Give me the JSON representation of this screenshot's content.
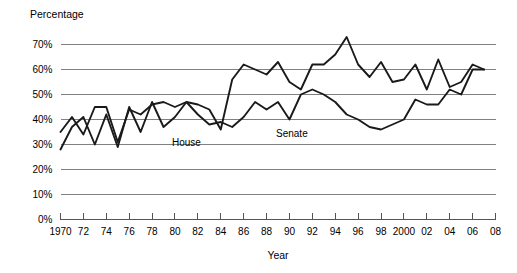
{
  "chart_data": {
    "type": "line",
    "title": "",
    "ylabel": "Percentage",
    "xlabel": "Year",
    "ylim": [
      0,
      70
    ],
    "xlim": [
      1970,
      2008
    ],
    "grid": true,
    "legend_position": "inline-annotation",
    "ytick_labels": [
      "70%",
      "60%",
      "50%",
      "40%",
      "30%",
      "20%",
      "10%",
      "0%"
    ],
    "ytick_values": [
      70,
      60,
      50,
      40,
      30,
      20,
      10,
      0
    ],
    "xtick_labels": [
      "1970",
      "72",
      "74",
      "76",
      "78",
      "80",
      "82",
      "84",
      "86",
      "88",
      "90",
      "92",
      "94",
      "96",
      "98",
      "2000",
      "02",
      "04",
      "06",
      "08"
    ],
    "xtick_values": [
      1970,
      1972,
      1974,
      1976,
      1978,
      1980,
      1982,
      1984,
      1986,
      1988,
      1990,
      1992,
      1994,
      1996,
      1998,
      2000,
      2002,
      2004,
      2006,
      2008
    ],
    "x": [
      1970,
      1971,
      1972,
      1973,
      1974,
      1975,
      1976,
      1977,
      1978,
      1979,
      1980,
      1981,
      1982,
      1983,
      1984,
      1985,
      1986,
      1987,
      1988,
      1989,
      1990,
      1991,
      1992,
      1993,
      1994,
      1995,
      1996,
      1997,
      1998,
      1999,
      2000,
      2001,
      2002,
      2003,
      2004,
      2005,
      2006,
      2007
    ],
    "series": [
      {
        "name": "House",
        "label": "House",
        "values": [
          28,
          37,
          41,
          30,
          42,
          29,
          45,
          35,
          47,
          37,
          41,
          47,
          42,
          38,
          39,
          37,
          41,
          47,
          44,
          47,
          40,
          50,
          52,
          50,
          47,
          42,
          40,
          37,
          36,
          38,
          40,
          48,
          46,
          46,
          52,
          50,
          60,
          60
        ]
      },
      {
        "name": "Senate",
        "label": "Senate",
        "values": [
          35,
          41,
          34,
          45,
          45,
          31,
          44,
          42,
          46,
          47,
          45,
          47,
          46,
          44,
          36,
          56,
          62,
          60,
          58,
          63,
          55,
          52,
          62,
          62,
          66,
          73,
          62,
          57,
          63,
          55,
          56,
          62,
          52,
          64,
          53,
          55,
          62,
          60
        ]
      }
    ]
  }
}
